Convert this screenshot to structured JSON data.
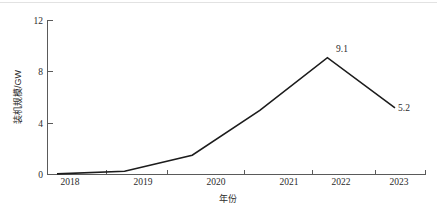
{
  "chart_data": {
    "type": "line",
    "title": "",
    "subtitle": "",
    "xlabel": "年份",
    "ylabel": "装机规模/GW",
    "x": [
      "2018",
      "2019",
      "2020",
      "2021",
      "2022",
      "2023"
    ],
    "categories": [
      "2018",
      "2019",
      "2020",
      "2021",
      "2022",
      "2023"
    ],
    "series": [
      {
        "name": "装机规模",
        "values": [
          0.05,
          0.25,
          1.5,
          5.0,
          9.1,
          5.2
        ],
        "color": "#1c1c1c"
      }
    ],
    "xlim": [
      "2018",
      "2023"
    ],
    "ylim": [
      0,
      12
    ],
    "yticks": [
      "0",
      "4",
      "8",
      "12"
    ],
    "ytick_values": [
      0,
      4,
      8,
      12
    ],
    "xticks": [
      "2018",
      "2019",
      "2020",
      "2021",
      "2022",
      "2023"
    ],
    "grid": false,
    "legend": "none",
    "annotations": [
      {
        "text": "9.1",
        "x": "2022",
        "y": 9.1
      },
      {
        "text": "5.2",
        "x": "2023",
        "y": 5.2
      }
    ]
  },
  "figure": {
    "axis_color": "#5a5a5a",
    "line_color": "#1c1c1c",
    "background": "#ffffff"
  }
}
